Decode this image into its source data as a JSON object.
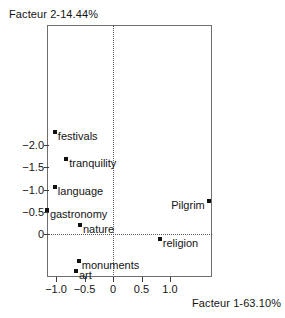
{
  "chart_data": {
    "type": "scatter",
    "title": "",
    "xlabel": "Facteur 1-63.10%",
    "ylabel": "Facteur 2-14.44%",
    "xlim": [
      -1.16,
      1.74
    ],
    "ylim": [
      -2.42,
      0.95
    ],
    "y_axis_inverted": true,
    "grid": false,
    "legend": null,
    "reference_lines": {
      "x": 0,
      "y": 0,
      "style": "dotted"
    },
    "xticks": [
      -1.0,
      -0.5,
      0,
      0.5,
      1.0
    ],
    "xticklabels": [
      "−1.0",
      "−0.5",
      "0",
      "0.5",
      "1.0"
    ],
    "yticks": [
      -2.0,
      -1.5,
      -1.0,
      -0.5,
      0
    ],
    "yticklabels": [
      "−2.0",
      "−1.5",
      "−1.0",
      "−0.5",
      "0"
    ],
    "points": [
      {
        "label": "festivals",
        "x": -1.02,
        "y": -2.29,
        "label_side": "right"
      },
      {
        "label": "tranquility",
        "x": -0.82,
        "y": -1.68,
        "label_side": "right"
      },
      {
        "label": "language",
        "x": -1.02,
        "y": -1.06,
        "label_side": "right"
      },
      {
        "label": "Pilgrim",
        "x": 1.68,
        "y": -0.75,
        "label_side": "left"
      },
      {
        "label": "gastronomy",
        "x": -1.16,
        "y": -0.54,
        "label_side": "right"
      },
      {
        "label": "nature",
        "x": -0.58,
        "y": -0.2,
        "label_side": "right"
      },
      {
        "label": "religion",
        "x": 0.82,
        "y": 0.11,
        "label_side": "right"
      },
      {
        "label": "monuments",
        "x": -0.6,
        "y": 0.61,
        "label_side": "right"
      },
      {
        "label": "art",
        "x": -0.65,
        "y": 0.83,
        "label_side": "right"
      }
    ]
  },
  "axes": {
    "y_title": "Facteur 2-14.44%",
    "x_title": "Facteur 1-63.10%"
  },
  "ticklabels": {
    "x": [
      "−1.0",
      "−0.5",
      "0",
      "0.5",
      "1.0"
    ],
    "y": [
      "−2.0",
      "−1.5",
      "−1.0",
      "−0.5",
      "0"
    ]
  },
  "points": {
    "festivals": "festivals",
    "tranquility": "tranquility",
    "language": "language",
    "pilgrim": "Pilgrim",
    "gastronomy": "gastronomy",
    "nature": "nature",
    "religion": "religion",
    "monuments": "monuments",
    "art": "art"
  },
  "colors": {
    "marker": "#111111",
    "frame": "#6e6e6e",
    "reference_line": "#5a5a5a",
    "text": "#141414",
    "background": "#ffffff"
  }
}
